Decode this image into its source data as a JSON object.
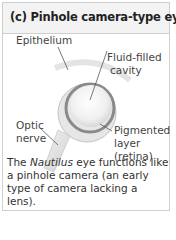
{
  "panel": {
    "title": "(c) Pinhole camera-type eye"
  },
  "diagram": {
    "labels": {
      "epithelium": "Epithelium",
      "fluid_line1": "Fluid-filled",
      "fluid_line2": "cavity",
      "optic_line1": "Optic",
      "optic_line2": "nerve",
      "pigment_line1": "Pigmented",
      "pigment_line2": "layer",
      "pigment_line3": "(retina)"
    }
  },
  "caption": {
    "part1": "The ",
    "italic": "Nautilus",
    "part2": " eye functions like a pinhole camera (an early type of camera lacking a lens)."
  }
}
